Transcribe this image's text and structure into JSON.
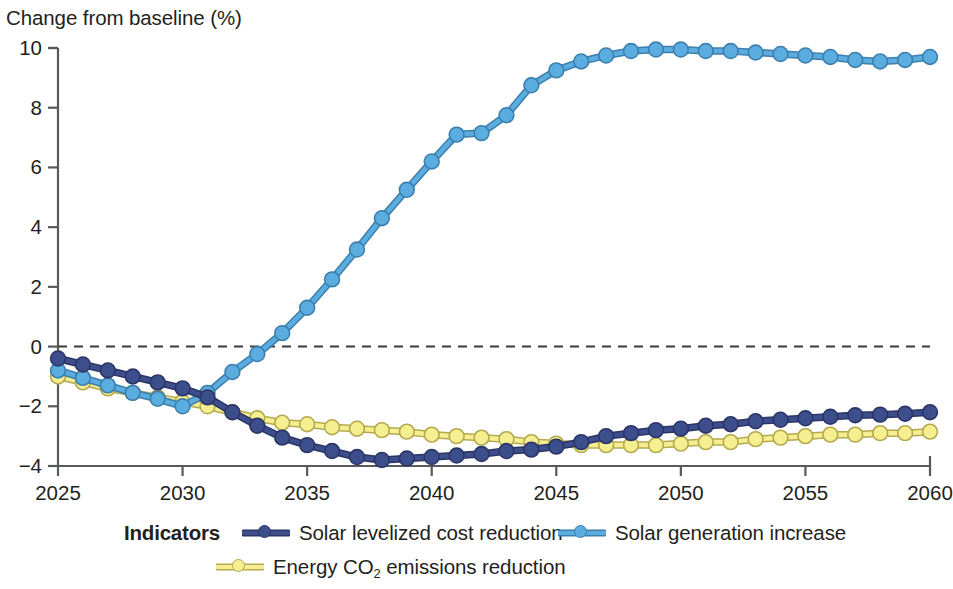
{
  "chart_data": {
    "type": "line",
    "title": "Change from baseline (%)",
    "ylabel": "Change from baseline (%)",
    "xlabel": "",
    "ylim": [
      -4,
      10
    ],
    "xlim": [
      2025,
      2060
    ],
    "yticks": [
      -4,
      -2,
      0,
      2,
      4,
      6,
      8,
      10
    ],
    "ytick_labels": [
      "−4",
      "−2",
      "0",
      "2",
      "4",
      "6",
      "8",
      "10"
    ],
    "xticks": [
      2025,
      2030,
      2035,
      2040,
      2045,
      2050,
      2055,
      2060
    ],
    "xtick_labels": [
      "2025",
      "2030",
      "2035",
      "2040",
      "2045",
      "2050",
      "2055",
      "2060"
    ],
    "grid": false,
    "zero_reference_line": 0,
    "legend_position": "bottom",
    "legend_title": "Indicators",
    "x": [
      2025,
      2026,
      2027,
      2028,
      2029,
      2030,
      2031,
      2032,
      2033,
      2034,
      2035,
      2036,
      2037,
      2038,
      2039,
      2040,
      2041,
      2042,
      2043,
      2044,
      2045,
      2046,
      2047,
      2048,
      2049,
      2050,
      2051,
      2052,
      2053,
      2054,
      2055,
      2056,
      2057,
      2058,
      2059,
      2060
    ],
    "series": [
      {
        "name": "Solar levelized cost reduction",
        "color": "#3d4e8c",
        "marker_color": "#3d4e8c",
        "values": [
          -0.4,
          -0.6,
          -0.8,
          -1.0,
          -1.2,
          -1.4,
          -1.7,
          -2.2,
          -2.65,
          -3.05,
          -3.3,
          -3.5,
          -3.7,
          -3.8,
          -3.75,
          -3.7,
          -3.65,
          -3.6,
          -3.5,
          -3.45,
          -3.35,
          -3.2,
          -3.0,
          -2.9,
          -2.8,
          -2.75,
          -2.65,
          -2.6,
          -2.5,
          -2.45,
          -2.4,
          -2.35,
          -2.3,
          -2.28,
          -2.25,
          -2.2
        ]
      },
      {
        "name": "Solar generation increase",
        "color": "#5badE0",
        "marker_color": "#5badE0",
        "values": [
          -0.8,
          -1.05,
          -1.3,
          -1.55,
          -1.75,
          -2.0,
          -1.55,
          -0.85,
          -0.25,
          0.45,
          1.3,
          2.25,
          3.25,
          4.3,
          5.25,
          6.2,
          7.1,
          7.15,
          7.75,
          8.75,
          9.25,
          9.55,
          9.75,
          9.9,
          9.95,
          9.95,
          9.9,
          9.9,
          9.85,
          9.8,
          9.75,
          9.7,
          9.6,
          9.55,
          9.6,
          9.7
        ]
      },
      {
        "name": "Energy CO2 emissions reduction",
        "color": "#f6ef91",
        "marker_color": "#f6ef91",
        "values": [
          -1.0,
          -1.2,
          -1.4,
          -1.55,
          -1.7,
          -1.85,
          -2.0,
          -2.2,
          -2.4,
          -2.55,
          -2.6,
          -2.7,
          -2.75,
          -2.8,
          -2.85,
          -2.95,
          -3.0,
          -3.05,
          -3.1,
          -3.2,
          -3.25,
          -3.3,
          -3.3,
          -3.3,
          -3.3,
          -3.25,
          -3.2,
          -3.2,
          -3.1,
          -3.05,
          -3.0,
          -2.95,
          -2.95,
          -2.9,
          -2.9,
          -2.85
        ]
      }
    ]
  },
  "legend": {
    "title": "Indicators",
    "entries": [
      {
        "label_html": "Solar levelized cost reduction",
        "color": "#3d4e8c"
      },
      {
        "label_html": "Solar generation increase",
        "color": "#5badE0"
      },
      {
        "label_html": "Energy CO",
        "label_sub": "2",
        "label_tail": " emissions reduction",
        "color": "#f6ef91"
      }
    ]
  }
}
